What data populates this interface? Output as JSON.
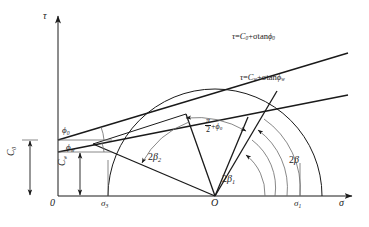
{
  "figure": {
    "type": "mohr-circle-failure-envelope-diagram",
    "axes": {
      "tau_label": "τ",
      "sigma_label": "σ",
      "origin_label": "0",
      "circle_center_label": "O"
    },
    "ticks": {
      "sigma3": "σ",
      "sigma3_sub": "3",
      "sigma1": "σ",
      "sigma1_sub": "1"
    },
    "envelopes": [
      {
        "name": "peak-envelope",
        "equation_tau": "τ",
        "equation_eq": "=",
        "equation_c": "C",
        "equation_c_sub": "0",
        "equation_rest": "+σtan",
        "equation_phi": "ϕ",
        "equation_phi_sub": "0",
        "intercept_label": "C",
        "intercept_sub": "0",
        "angle_label": "ϕ",
        "angle_sub": "0"
      },
      {
        "name": "residual-envelope",
        "equation_tau": "τ",
        "equation_eq": "=",
        "equation_c": "C",
        "equation_c_sub": "w",
        "equation_rest": "+σtan",
        "equation_phi": "ϕ",
        "equation_phi_sub": "w",
        "intercept_label": "C",
        "intercept_sub": "w",
        "angle_label": "ϕ",
        "angle_sub": "w"
      }
    ],
    "angles": [
      {
        "name": "two-beta-1",
        "prefix": "2",
        "symbol": "β",
        "sub": "1"
      },
      {
        "name": "two-beta-2",
        "prefix": "2",
        "symbol": "β",
        "sub": "2"
      },
      {
        "name": "two-beta",
        "prefix": "2",
        "symbol": "β",
        "sub": ""
      },
      {
        "name": "half-pi-plus-phi0",
        "num": "π",
        "den": "2",
        "plus": "+",
        "symbol": "ϕ",
        "sub": "0"
      }
    ],
    "colors": {
      "stroke": "#1a1a1a",
      "thin": "#6a6a6a",
      "background": "#ffffff"
    }
  }
}
